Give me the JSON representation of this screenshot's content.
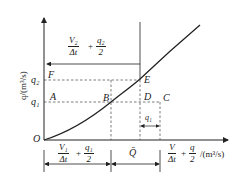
{
  "diagram": {
    "y_axis_label": "q/(m³/s)",
    "x_axis_unit": "/(m³/s)",
    "origin": "O",
    "y_ticks": [
      "q₂",
      "q₁"
    ],
    "points": {
      "F": "F",
      "A": "A",
      "B": "B",
      "E": "E",
      "D": "D",
      "C": "C"
    },
    "top_bracket": {
      "frac1_num": "V₂",
      "frac1_den": "Δt",
      "plus": "+",
      "frac2_num": "q₂",
      "frac2_den": "2"
    },
    "bottom_left": {
      "frac1_num": "V₁",
      "frac1_den": "Δt",
      "plus": "+",
      "frac2_num": "q₁",
      "frac2_den": "2"
    },
    "bottom_mid": "Q̄",
    "bottom_right": {
      "frac1_num": "V",
      "frac1_den": "Δt",
      "plus": "+",
      "frac2_num": "q",
      "frac2_den": "2"
    },
    "dc_width_label": "q₁",
    "line_color": "#222222"
  }
}
